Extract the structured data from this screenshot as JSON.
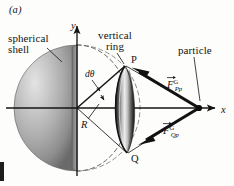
{
  "figure": {
    "panel_letter": "(a)",
    "background_color": "#fdfdfb",
    "ink_color": "#141414",
    "width": 234,
    "height": 186
  },
  "labels": {
    "spherical_shell": "spherical shell",
    "vertical_ring": "vertical ring",
    "particle": "particle",
    "point_P": "P",
    "point_Q": "Q",
    "radius": "R",
    "angle_element": "dθ",
    "axis_x": "x",
    "axis_y": "y"
  },
  "forces": [
    {
      "name": "force-on-particle-from-P",
      "symbol": "F",
      "superscript": "G",
      "subscript": "Pp",
      "full": "F⃗ᴳPp",
      "direction": "left-and-up toward ring point P"
    },
    {
      "name": "force-on-particle-from-Q",
      "symbol": "F",
      "superscript": "G",
      "subscript": "Qp",
      "full": "F⃗ᴳQp",
      "direction": "left-and-down toward ring point Q"
    }
  ],
  "geometry": {
    "origin": {
      "x": 77,
      "y": 108
    },
    "particle": {
      "x": 199,
      "y": 108
    },
    "point_P": {
      "x": 125,
      "y": 66
    },
    "point_Q": {
      "x": 127,
      "y": 153
    },
    "sphere_center": {
      "x": 77,
      "y": 108
    },
    "sphere_radius": 63,
    "ring_center": {
      "x": 126,
      "y": 109
    },
    "axis_x_end": {
      "x": 218,
      "y": 108
    },
    "axis_y_end": {
      "x": 77,
      "y": 28
    }
  },
  "colors": {
    "shell_light": "#cfcfcf",
    "shell_mid": "#a5a5a5",
    "shell_dark": "#6e6e6e",
    "cut_face": "#9a9a9a",
    "ring_dark": "#2a2a2a",
    "ring_light": "#d8d8d8",
    "dashed_outline": "#5a5a5a",
    "vector_black": "#111111"
  }
}
